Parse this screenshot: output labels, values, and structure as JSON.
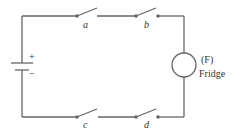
{
  "diagram": {
    "type": "circuit",
    "battery": {
      "plus_label": "+",
      "minus_label": "−"
    },
    "switches": [
      {
        "id": "a",
        "label": "a",
        "branch": "top"
      },
      {
        "id": "b",
        "label": "b",
        "branch": "top"
      },
      {
        "id": "c",
        "label": "c",
        "branch": "bottom"
      },
      {
        "id": "d",
        "label": "d",
        "branch": "bottom"
      }
    ],
    "load": {
      "symbol_label": "(F)",
      "name": "Fridge"
    },
    "colors": {
      "wire": "#666666",
      "text": "#333333"
    }
  }
}
